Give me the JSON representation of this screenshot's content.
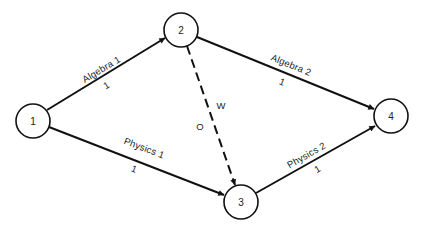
{
  "diagram": {
    "type": "activity-network",
    "nodes": [
      {
        "id": "1",
        "label": "1",
        "cx": 33,
        "cy": 121,
        "r": 17
      },
      {
        "id": "2",
        "label": "2",
        "cx": 181,
        "cy": 30,
        "r": 17
      },
      {
        "id": "3",
        "label": "3",
        "cx": 241,
        "cy": 202,
        "r": 17
      },
      {
        "id": "4",
        "label": "4",
        "cx": 391,
        "cy": 116,
        "r": 17
      }
    ],
    "edges": [
      {
        "id": "e12",
        "from": "1",
        "to": "2",
        "name": "Algebra 1",
        "duration": "1",
        "style": "solid"
      },
      {
        "id": "e24",
        "from": "2",
        "to": "4",
        "name": "Algebra 2",
        "duration": "1",
        "style": "solid"
      },
      {
        "id": "e13",
        "from": "1",
        "to": "3",
        "name": "Physics 1",
        "duration": "1",
        "style": "solid"
      },
      {
        "id": "e34",
        "from": "3",
        "to": "4",
        "name": "Physics 2",
        "duration": "1",
        "style": "solid"
      },
      {
        "id": "e23",
        "from": "2",
        "to": "3",
        "name": "W",
        "duration": "O",
        "style": "dashed"
      }
    ]
  }
}
